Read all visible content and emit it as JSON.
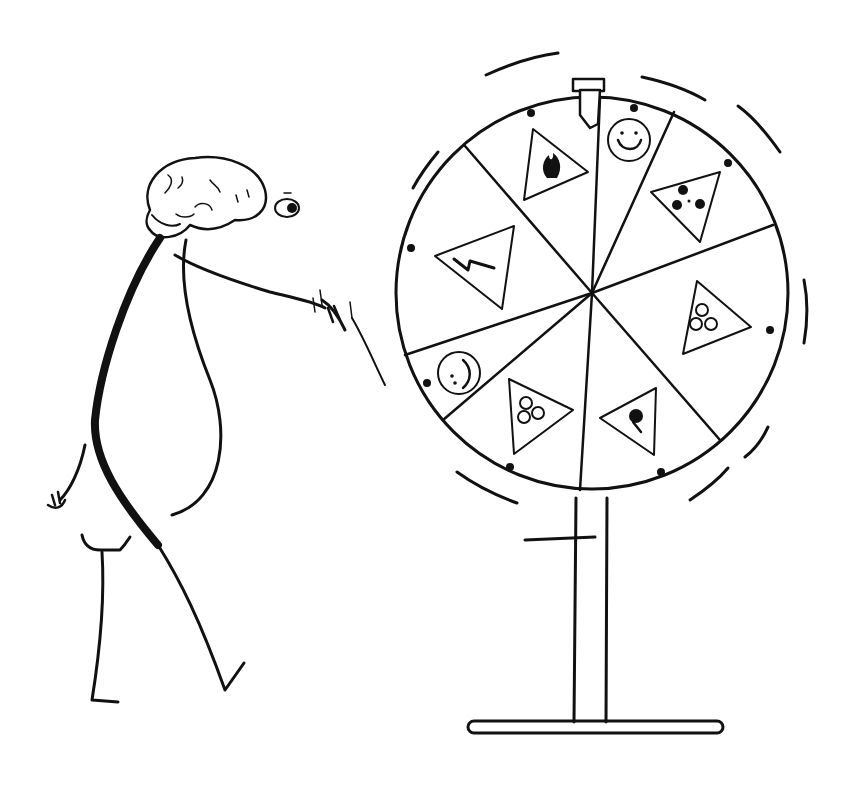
{
  "illustration": {
    "subject": "Brain-headed stick figure spinning a prize wheel of hazards",
    "colors": {
      "ink": "#111111",
      "background": "#ffffff"
    },
    "wheel": {
      "segments": [
        {
          "icon": "flammable-icon",
          "shape": "warning-triangle"
        },
        {
          "icon": "smiley-icon",
          "shape": "circle"
        },
        {
          "icon": "radiation-icon",
          "shape": "warning-triangle"
        },
        {
          "icon": "biohazard-icon",
          "shape": "warning-triangle"
        },
        {
          "icon": "explosive-icon",
          "shape": "warning-triangle"
        },
        {
          "icon": "biohazard-icon",
          "shape": "warning-triangle"
        },
        {
          "icon": "smiley-icon",
          "shape": "circle"
        },
        {
          "icon": "high-voltage-icon",
          "shape": "warning-triangle"
        }
      ]
    },
    "caption": ""
  }
}
